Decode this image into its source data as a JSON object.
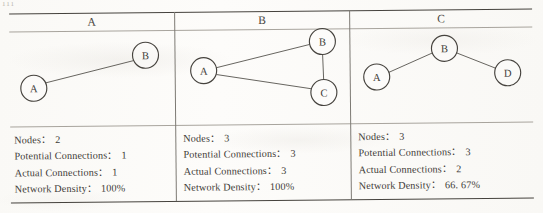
{
  "page": {
    "corner_mark": "111"
  },
  "table": {
    "separator": "：",
    "panels": [
      {
        "id": "a",
        "header": "A",
        "graph": {
          "nodes": [
            {
              "label": "A",
              "cx": 24,
              "cy": 57,
              "r": 13
            },
            {
              "label": "B",
              "cx": 136,
              "cy": 25,
              "r": 13
            }
          ],
          "edges": [
            {
              "from": 0,
              "to": 1
            }
          ]
        },
        "stats": [
          {
            "label": "Nodes",
            "value": "2"
          },
          {
            "label": "Potential Connections",
            "value": "1"
          },
          {
            "label": "Actual Connections",
            "value": "1"
          },
          {
            "label": "Network Density",
            "value": "100%"
          }
        ]
      },
      {
        "id": "b",
        "header": "B",
        "graph": {
          "nodes": [
            {
              "label": "A",
              "cx": 28,
              "cy": 41,
              "r": 13
            },
            {
              "label": "B",
              "cx": 147,
              "cy": 13,
              "r": 13
            },
            {
              "label": "C",
              "cx": 148,
              "cy": 64,
              "r": 13
            }
          ],
          "edges": [
            {
              "from": 0,
              "to": 1
            },
            {
              "from": 0,
              "to": 2
            },
            {
              "from": 1,
              "to": 2
            }
          ]
        },
        "stats": [
          {
            "label": "Nodes",
            "value": "3"
          },
          {
            "label": "Potential Connections",
            "value": "3"
          },
          {
            "label": "Actual Connections",
            "value": "3"
          },
          {
            "label": "Network Density",
            "value": "100%"
          }
        ]
      },
      {
        "id": "c",
        "header": "C",
        "graph": {
          "nodes": [
            {
              "label": "A",
              "cx": 26,
              "cy": 49,
              "r": 13
            },
            {
              "label": "B",
              "cx": 94,
              "cy": 21,
              "r": 13
            },
            {
              "label": "D",
              "cx": 157,
              "cy": 46,
              "r": 13
            }
          ],
          "edges": [
            {
              "from": 0,
              "to": 1
            },
            {
              "from": 1,
              "to": 2
            }
          ]
        },
        "stats": [
          {
            "label": "Nodes",
            "value": "3"
          },
          {
            "label": "Potential Connections",
            "value": "3"
          },
          {
            "label": "Actual Connections",
            "value": "2"
          },
          {
            "label": "Network Density",
            "value": "66. 67%"
          }
        ]
      }
    ]
  }
}
